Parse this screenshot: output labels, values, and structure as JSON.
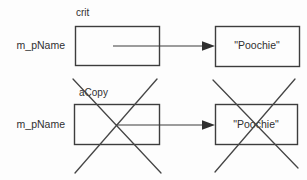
{
  "diagram": {
    "description_colors": {
      "line": "#3d3d3d",
      "text": "#303030",
      "background": "#fdfdfd"
    },
    "rows": [
      {
        "variable_label": "crit",
        "pointer_name": "m_pName",
        "string_value": "\"Poochie\"",
        "crossed_out": false
      },
      {
        "variable_label": "aCopy",
        "pointer_name": "m_pName",
        "string_value": "\"Poochie\"",
        "crossed_out": true
      }
    ]
  }
}
